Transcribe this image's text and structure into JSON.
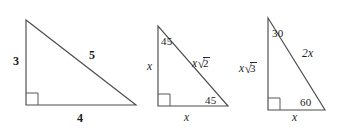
{
  "figure": {
    "background_color": "#ffffff",
    "line_color": "#4d4d4d",
    "text_color": "#1c1c1c"
  },
  "triangles": [
    {
      "name": "3-4-5 right triangle",
      "vertices": {
        "apex": [
          26,
          20
        ],
        "right_angle": [
          26,
          105
        ],
        "base_right": [
          136,
          105
        ]
      },
      "right_angle_marker": true,
      "labels": {
        "vertical_leg": "3",
        "horizontal_leg": "4",
        "hypotenuse": "5"
      }
    },
    {
      "name": "45-45-90 right triangle",
      "vertices": {
        "apex": [
          158,
          26
        ],
        "right_angle": [
          158,
          106
        ],
        "base_right": [
          228,
          106
        ]
      },
      "right_angle_marker": true,
      "labels": {
        "vertical_leg": "x",
        "horizontal_leg": "x",
        "hypotenuse_var": "x",
        "hypotenuse_radicand": "2",
        "top_angle": "45",
        "bottom_right_angle": "45"
      }
    },
    {
      "name": "30-60-90 right triangle",
      "vertices": {
        "apex": [
          268,
          18
        ],
        "right_angle": [
          268,
          110
        ],
        "base_right": [
          325,
          110
        ]
      },
      "right_angle_marker": true,
      "labels": {
        "vertical_leg_var": "x",
        "vertical_leg_radicand": "3",
        "horizontal_leg": "x",
        "hypotenuse": "2x",
        "top_angle": "30",
        "bottom_right_angle": "60"
      }
    }
  ]
}
